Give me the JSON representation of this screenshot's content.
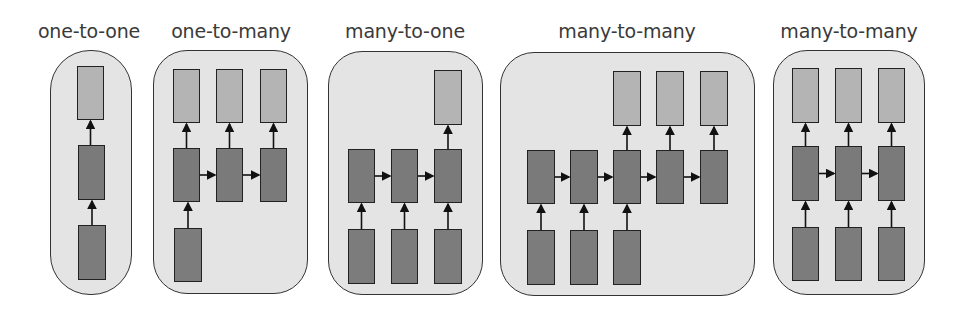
{
  "diagram": {
    "colors": {
      "panel_bg": "#e4e4e4",
      "output_box": "#b4b4b4",
      "hidden_box": "#7a7a7a",
      "input_box": "#7c7c7c",
      "border": "#333333",
      "text": "#3a3a3a"
    },
    "panels": [
      {
        "label": "one-to-one",
        "label_x": 89,
        "rect": [
          50,
          50,
          82,
          245
        ],
        "radius": 40,
        "outputs": [
          [
            77,
            66,
            27,
            54
          ]
        ],
        "hidden": [
          [
            78,
            145,
            27,
            55
          ]
        ],
        "inputs": [
          [
            78,
            225,
            28,
            55
          ]
        ]
      },
      {
        "label": "one-to-many",
        "label_x": 231,
        "rect": [
          153,
          50,
          155,
          244
        ],
        "radius": 34,
        "outputs": [
          [
            173,
            69,
            27,
            54
          ],
          [
            216,
            69,
            27,
            54
          ],
          [
            260,
            69,
            27,
            54
          ]
        ],
        "hidden": [
          [
            173,
            148,
            27,
            54
          ],
          [
            216,
            148,
            27,
            54
          ],
          [
            260,
            148,
            27,
            54
          ]
        ],
        "inputs": [
          [
            174,
            228,
            28,
            54
          ]
        ]
      },
      {
        "label": "many-to-one",
        "label_x": 405,
        "rect": [
          328,
          51,
          155,
          244
        ],
        "radius": 34,
        "outputs": [
          [
            434,
            70,
            28,
            55
          ]
        ],
        "hidden": [
          [
            348,
            149,
            27,
            54
          ],
          [
            391,
            149,
            27,
            54
          ],
          [
            434,
            149,
            28,
            54
          ]
        ],
        "inputs": [
          [
            348,
            229,
            27,
            55
          ],
          [
            391,
            229,
            27,
            55
          ],
          [
            434,
            229,
            28,
            55
          ]
        ]
      },
      {
        "label": "many-to-many",
        "label_x": 627,
        "rect": [
          500,
          52,
          255,
          244
        ],
        "radius": 34,
        "outputs": [
          [
            613,
            71,
            28,
            55
          ],
          [
            656,
            71,
            28,
            55
          ],
          [
            700,
            71,
            28,
            55
          ]
        ],
        "hidden": [
          [
            527,
            150,
            28,
            54
          ],
          [
            570,
            150,
            28,
            54
          ],
          [
            613,
            150,
            28,
            54
          ],
          [
            656,
            150,
            28,
            54
          ],
          [
            700,
            150,
            28,
            54
          ]
        ],
        "inputs": [
          [
            527,
            230,
            28,
            55
          ],
          [
            570,
            230,
            28,
            55
          ],
          [
            613,
            230,
            28,
            55
          ]
        ]
      },
      {
        "label": "many-to-many",
        "label_x": 849,
        "rect": [
          773,
          50,
          152,
          245
        ],
        "radius": 34,
        "outputs": [
          [
            792,
            68,
            27,
            55
          ],
          [
            835,
            68,
            27,
            55
          ],
          [
            878,
            68,
            27,
            55
          ]
        ],
        "hidden": [
          [
            792,
            146,
            27,
            55
          ],
          [
            835,
            146,
            27,
            55
          ],
          [
            878,
            146,
            27,
            55
          ]
        ],
        "inputs": [
          [
            792,
            227,
            27,
            54
          ],
          [
            835,
            227,
            27,
            54
          ],
          [
            878,
            227,
            27,
            54
          ]
        ]
      }
    ]
  }
}
